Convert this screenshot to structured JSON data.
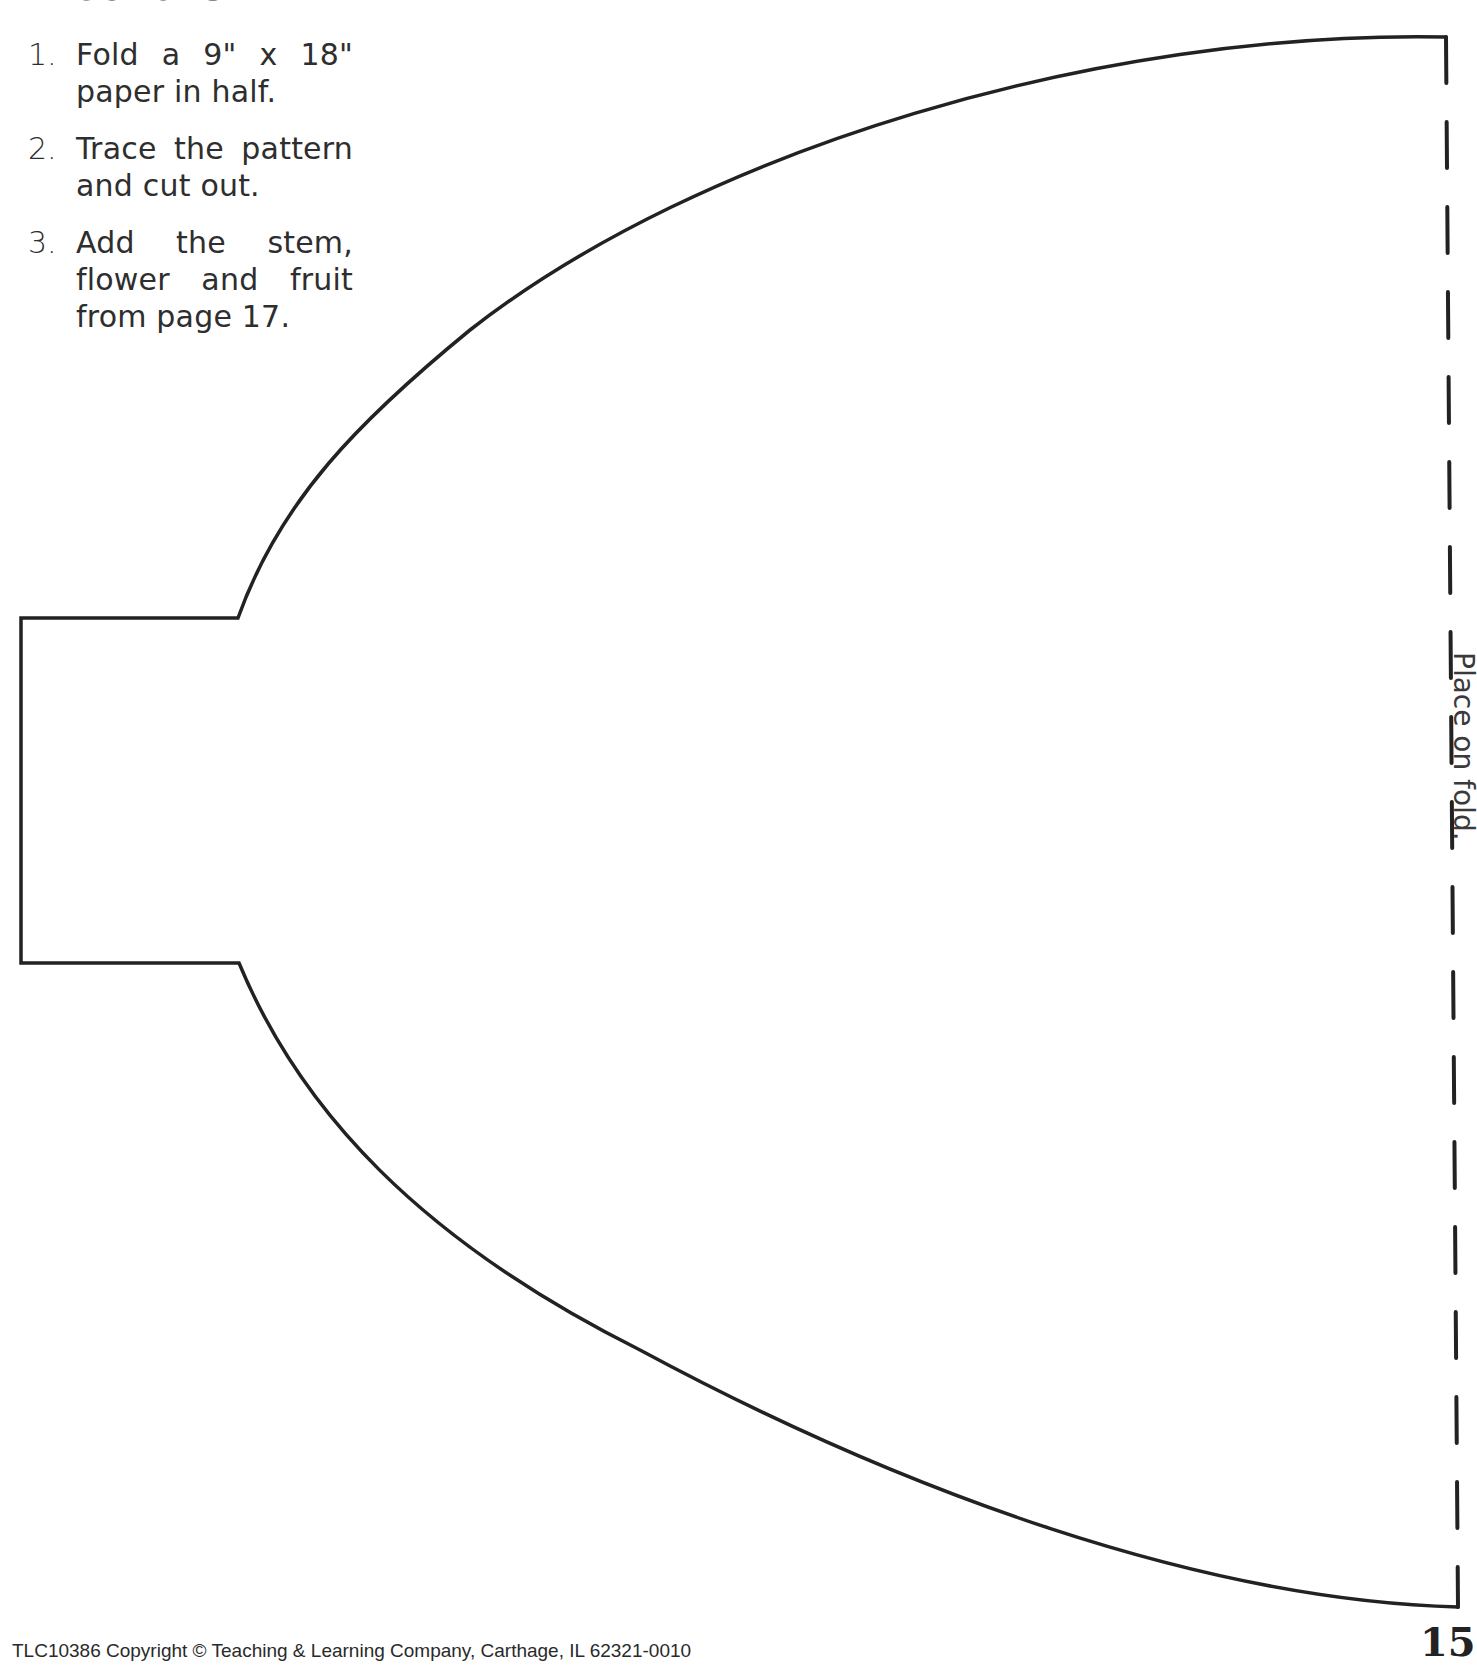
{
  "document": {
    "heading": "Directions",
    "steps": [
      {
        "number": "1.",
        "text": "Fold a 9\" x 18\" paper in half."
      },
      {
        "number": "2.",
        "text": "Trace the pattern and cut out."
      },
      {
        "number": "3.",
        "text": "Add the stem, flower and fruit from page 17."
      }
    ],
    "fold_label": "Place on fold.",
    "footer": {
      "copyright": "TLC10386 Copyright © Teaching & Learning Company, Carthage, IL  62321-0010",
      "page_number": "15"
    }
  },
  "pattern": {
    "stroke_color": "#222222",
    "outline_path": "M 1446 37 C 1100 30, 700 150, 470 330 C 360 420, 280 500, 238 618 L 21 618 L 21 963 L 239 963 C 300 1110, 420 1240, 640 1350 C 900 1490, 1200 1600, 1458 1607",
    "outline_width": 3.5,
    "fold_line": {
      "x_top": 1446,
      "y_top": 37,
      "x_bottom": 1458,
      "y_bottom": 1607,
      "dash_pattern": "46 39",
      "width": 4
    }
  }
}
